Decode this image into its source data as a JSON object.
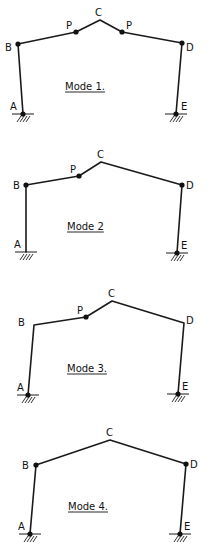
{
  "figure": {
    "type": "portal-frame-collapse-mechanisms",
    "colors": {
      "line": "#1a1a1a",
      "hinge": "#111111",
      "background": "#ffffff"
    },
    "modes": [
      {
        "label": "Mode 1.",
        "label_pos": [
          65,
          90
        ],
        "nodes": {
          "A": {
            "x": 23,
            "y": 114,
            "label": "A",
            "hinge": true,
            "support": true,
            "lx": 10,
            "ly": 110
          },
          "B": {
            "x": 18,
            "y": 44,
            "label": "B",
            "hinge": true,
            "lx": 5,
            "ly": 51
          },
          "P1": {
            "x": 76,
            "y": 32,
            "label": "P",
            "hinge": true,
            "lx": 66,
            "ly": 29
          },
          "C": {
            "x": 100,
            "y": 20,
            "label": "C",
            "hinge": false,
            "lx": 95,
            "ly": 16
          },
          "P2": {
            "x": 122,
            "y": 32,
            "label": "P",
            "hinge": true,
            "lx": 126,
            "ly": 29
          },
          "D": {
            "x": 182,
            "y": 43,
            "label": "D",
            "hinge": true,
            "lx": 186,
            "ly": 51
          },
          "E": {
            "x": 176,
            "y": 114,
            "label": "E",
            "hinge": true,
            "support": true,
            "lx": 181,
            "ly": 110
          }
        },
        "path": [
          "A",
          "B",
          "P1",
          "C",
          "P2",
          "D",
          "E"
        ]
      },
      {
        "label": "Mode 2",
        "label_pos": [
          67,
          230
        ],
        "nodes": {
          "A": {
            "x": 26,
            "y": 252,
            "label": "A",
            "hinge": false,
            "support": true,
            "lx": 14,
            "ly": 248
          },
          "B": {
            "x": 26,
            "y": 185,
            "label": "B",
            "hinge": true,
            "lx": 13,
            "ly": 189
          },
          "P": {
            "x": 79,
            "y": 176,
            "label": "P",
            "hinge": true,
            "lx": 70,
            "ly": 173
          },
          "C": {
            "x": 101,
            "y": 162,
            "label": "C",
            "hinge": false,
            "lx": 97,
            "ly": 158
          },
          "D": {
            "x": 182,
            "y": 185,
            "label": "D",
            "hinge": true,
            "lx": 186,
            "ly": 189
          },
          "E": {
            "x": 177,
            "y": 253,
            "label": "E",
            "hinge": true,
            "support": true,
            "lx": 181,
            "ly": 249
          }
        },
        "path": [
          "A",
          "B",
          "P",
          "C",
          "D",
          "E"
        ]
      },
      {
        "label": "Mode 3.",
        "label_pos": [
          67,
          372
        ],
        "nodes": {
          "A": {
            "x": 28,
            "y": 395,
            "label": "A",
            "hinge": true,
            "support": true,
            "lx": 17,
            "ly": 391
          },
          "B": {
            "x": 34,
            "y": 325,
            "label": "B",
            "hinge": false,
            "lx": 18,
            "ly": 326
          },
          "P": {
            "x": 86,
            "y": 317,
            "label": "P",
            "hinge": true,
            "lx": 77,
            "ly": 314
          },
          "C": {
            "x": 112,
            "y": 301,
            "label": "C",
            "hinge": false,
            "lx": 108,
            "ly": 297
          },
          "D": {
            "x": 184,
            "y": 323,
            "label": "D",
            "hinge": false,
            "lx": 186,
            "ly": 324
          },
          "E": {
            "x": 178,
            "y": 394,
            "label": "E",
            "hinge": true,
            "support": true,
            "lx": 182,
            "ly": 390
          }
        },
        "path": [
          "A",
          "B",
          "P",
          "C",
          "D",
          "E"
        ]
      },
      {
        "label": "Mode 4.",
        "label_pos": [
          68,
          510
        ],
        "nodes": {
          "A": {
            "x": 30,
            "y": 534,
            "label": "A",
            "hinge": true,
            "support": true,
            "lx": 18,
            "ly": 530
          },
          "B": {
            "x": 36,
            "y": 465,
            "label": "B",
            "hinge": true,
            "lx": 22,
            "ly": 469
          },
          "C": {
            "x": 110,
            "y": 440,
            "label": "C",
            "hinge": false,
            "lx": 106,
            "ly": 436
          },
          "D": {
            "x": 186,
            "y": 464,
            "label": "D",
            "hinge": true,
            "lx": 190,
            "ly": 468
          },
          "E": {
            "x": 180,
            "y": 534,
            "label": "E",
            "hinge": true,
            "support": true,
            "lx": 184,
            "ly": 530
          }
        },
        "path": [
          "A",
          "B",
          "C",
          "D",
          "E"
        ]
      }
    ]
  }
}
